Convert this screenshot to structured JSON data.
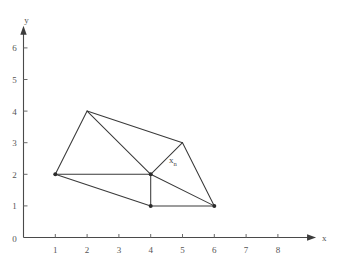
{
  "figure": {
    "background_color": "#ffffff",
    "line_color": "#3a3a3a",
    "axis_color": "#4a4a4a",
    "text_color": "#555555"
  },
  "axes": {
    "x_axis_label": "x",
    "y_axis_label": "y",
    "origin_label": "0",
    "x_ticks": [
      "1",
      "2",
      "3",
      "4",
      "5",
      "6",
      "7",
      "8"
    ],
    "y_ticks": [
      "1",
      "2",
      "3",
      "4",
      "5",
      "6"
    ],
    "x_tick_values": [
      1,
      2,
      3,
      4,
      5,
      6,
      7,
      8
    ],
    "y_tick_values": [
      1,
      2,
      3,
      4,
      5,
      6
    ],
    "x_range": [
      0,
      9.2
    ],
    "y_range": [
      0,
      6.7
    ]
  },
  "annotations": {
    "node_label_base": "x",
    "node_label_subscript": "n",
    "node_label_x": 4.7,
    "node_label_y": 2.35
  },
  "chart_data": {
    "type": "diagram",
    "title": "",
    "xlabel": "x",
    "ylabel": "y",
    "xlim": [
      0,
      9.2
    ],
    "ylim": [
      0,
      6.7
    ],
    "grid": false,
    "legend": "none",
    "vertices": [
      {
        "id": "v1",
        "x": 1,
        "y": 2
      },
      {
        "id": "v2",
        "x": 2,
        "y": 4
      },
      {
        "id": "v3",
        "x": 5,
        "y": 3
      },
      {
        "id": "v4",
        "x": 6,
        "y": 1
      },
      {
        "id": "v5",
        "x": 4,
        "y": 1
      },
      {
        "id": "v6",
        "x": 4,
        "y": 2,
        "label": "x_n"
      }
    ],
    "edges": [
      {
        "from": [
          1,
          2
        ],
        "to": [
          2,
          4
        ]
      },
      {
        "from": [
          2,
          4
        ],
        "to": [
          5,
          3
        ]
      },
      {
        "from": [
          5,
          3
        ],
        "to": [
          6,
          1
        ]
      },
      {
        "from": [
          6,
          1
        ],
        "to": [
          4,
          1
        ]
      },
      {
        "from": [
          4,
          1
        ],
        "to": [
          1,
          2
        ]
      },
      {
        "from": [
          1,
          2
        ],
        "to": [
          4,
          2
        ]
      },
      {
        "from": [
          2,
          4
        ],
        "to": [
          4,
          2
        ]
      },
      {
        "from": [
          4,
          2
        ],
        "to": [
          5,
          3
        ]
      },
      {
        "from": [
          4,
          2
        ],
        "to": [
          4,
          1
        ]
      },
      {
        "from": [
          4,
          2
        ],
        "to": [
          6,
          1
        ]
      }
    ],
    "marked_vertices": [
      {
        "x": 1,
        "y": 2
      },
      {
        "x": 4,
        "y": 2
      },
      {
        "x": 4,
        "y": 1
      },
      {
        "x": 6,
        "y": 1
      }
    ]
  }
}
